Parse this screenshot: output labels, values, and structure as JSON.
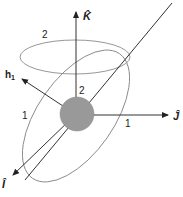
{
  "diagram": {
    "title": "",
    "axes": {
      "k": {
        "label": "K̂",
        "hat": "^"
      },
      "j": {
        "label": "Ĵ"
      },
      "i": {
        "label": "Î"
      },
      "h": {
        "label": "h",
        "subscript": "1"
      }
    },
    "orbits": {
      "orbit_2": {
        "label": "2",
        "inner_label": "2"
      },
      "orbit_1": {
        "label_left": "1",
        "label_right": "1"
      }
    },
    "colors": {
      "line": "#333333",
      "orbit": "#8a8a8a",
      "body": "#999999",
      "background": "#ffffff"
    }
  }
}
